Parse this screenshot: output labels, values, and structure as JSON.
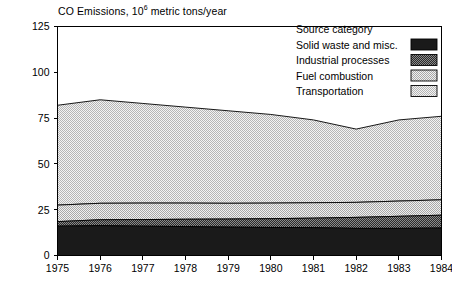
{
  "chart_data": {
    "type": "area",
    "title_main": "CO Emissions, 10",
    "title_exp": "6",
    "title_tail": " metric tons/year",
    "xlabel": "",
    "ylabel": "",
    "stacked": true,
    "grid": false,
    "x": [
      1975,
      1976,
      1977,
      1978,
      1979,
      1980,
      1981,
      1982,
      1983,
      1984
    ],
    "categories": [
      "1975",
      "1976",
      "1977",
      "1978",
      "1979",
      "1980",
      "1981",
      "1982",
      "1983",
      "1984"
    ],
    "xlim": [
      1975,
      1984
    ],
    "ylim": [
      0,
      125
    ],
    "yticks": [
      0,
      25,
      50,
      75,
      100,
      125
    ],
    "ytick_labels": [
      "0",
      "25",
      "50",
      "75",
      "100",
      "125"
    ],
    "series": [
      {
        "name": "Solid waste and misc.",
        "fill": "#1a1a1a",
        "pattern": "solid-black",
        "values": [
          16.0,
          16.3,
          16.0,
          15.8,
          15.5,
          15.3,
          15.2,
          14.8,
          14.8,
          15.0
        ]
      },
      {
        "name": "Industrial processes",
        "fill": "#4a4a4a",
        "pattern": "dense-dark",
        "values": [
          2.5,
          3.2,
          3.6,
          4.0,
          4.4,
          4.8,
          5.2,
          6.0,
          6.6,
          7.0
        ]
      },
      {
        "name": "Fuel combustion",
        "fill": "#d9d9d9",
        "pattern": "light-dots",
        "values": [
          9.0,
          9.0,
          9.0,
          8.8,
          8.6,
          8.5,
          8.4,
          8.2,
          8.3,
          8.4
        ]
      },
      {
        "name": "Transportation",
        "fill": "#e3e3e3",
        "pattern": "light-dots",
        "values": [
          54.5,
          56.5,
          54.4,
          52.4,
          50.5,
          48.4,
          45.2,
          40.0,
          44.3,
          45.6
        ]
      }
    ],
    "cumulative_tops": [
      82.0,
      85.0,
      83.0,
      81.0,
      79.0,
      77.0,
      74.0,
      69.0,
      74.0,
      76.0
    ],
    "legend": {
      "position": "top-right",
      "title": "Source category",
      "entries": [
        {
          "label": "Solid waste and misc.",
          "swatch": "solid-black"
        },
        {
          "label": "Industrial processes",
          "swatch": "dense-dark"
        },
        {
          "label": "Fuel combustion",
          "swatch": "light-dots"
        },
        {
          "label": "Transportation",
          "swatch": "light-dots"
        }
      ]
    }
  }
}
